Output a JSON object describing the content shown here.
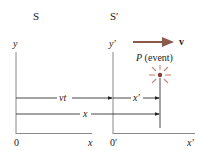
{
  "frames": {
    "s": {
      "label": "S",
      "y_axis": "y",
      "x_axis": "x",
      "origin": "0"
    },
    "s_prime": {
      "label": "S′",
      "y_axis": "y′",
      "x_axis": "x′",
      "origin": "0′"
    }
  },
  "velocity": {
    "label": "v",
    "color": "#8b5a4a"
  },
  "event": {
    "label": "P (event)",
    "color": "#b86a5a"
  },
  "distances": {
    "vt": "vt",
    "x_prime": "x′",
    "x": "x"
  }
}
